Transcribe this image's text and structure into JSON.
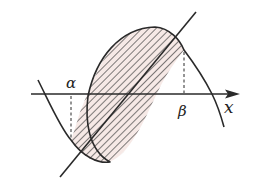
{
  "diagram": {
    "type": "area-between-curves",
    "labels": {
      "alpha": "α",
      "beta": "β",
      "x_axis": "x"
    },
    "colors": {
      "stroke": "#2a2a2a",
      "fill": "#f6e9e6",
      "hatch": "#3a3a3a"
    },
    "elements": [
      "x-axis with arrow",
      "cubic curve",
      "straight line",
      "shaded hatched region between curve and line from α to β",
      "dashed vertical lines at α and β"
    ]
  }
}
